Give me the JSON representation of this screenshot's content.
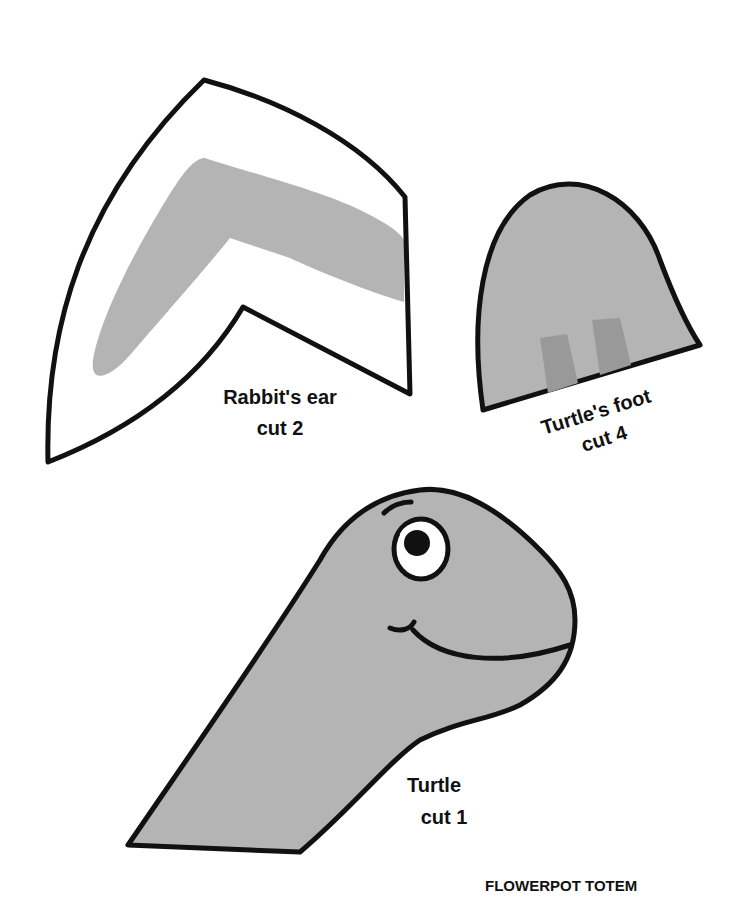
{
  "page": {
    "title": "FLOWERPOT TOTEM"
  },
  "colors": {
    "outline": "#111111",
    "fill_gray": "#b4b4b4",
    "fill_dark_gray": "#999999",
    "paper": "#ffffff"
  },
  "pieces": [
    {
      "name": "Rabbit's ear",
      "instruction": "cut 2"
    },
    {
      "name": "Turtle's foot",
      "instruction": "cut 4"
    },
    {
      "name": "Turtle",
      "instruction": "cut 1"
    }
  ]
}
